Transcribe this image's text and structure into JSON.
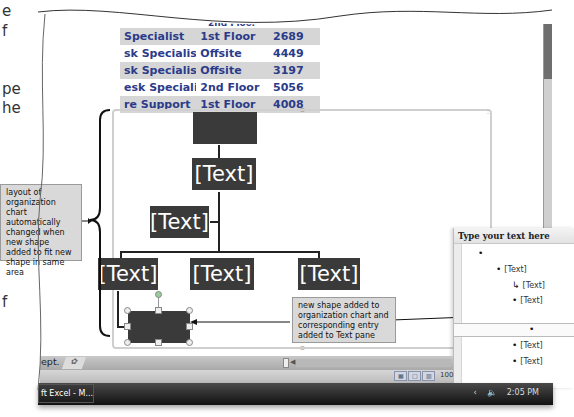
{
  "margin_fragments": [
    "e",
    "f",
    "pe",
    "he",
    "f"
  ],
  "spreadsheet": {
    "partial_top_row": "2nd Floor",
    "rows": [
      {
        "title": "Specialist",
        "location": "1st Floor",
        "ext": "2689",
        "shaded": true
      },
      {
        "title": "sk Specialist",
        "location": "Offsite",
        "ext": "4449",
        "shaded": false
      },
      {
        "title": "sk Specialist",
        "location": "Offsite",
        "ext": "3197",
        "shaded": true
      },
      {
        "title": "esk Specialist",
        "location": "2nd Floor",
        "ext": "5056",
        "shaded": false
      },
      {
        "title": "re Support",
        "location": "1st Floor",
        "ext": "4008",
        "shaded": true
      }
    ]
  },
  "org_chart": {
    "top_box": "",
    "level2": "[Text]",
    "assistant": "[Text]",
    "level3": [
      "[Text]",
      "[Text]",
      "[Text]"
    ],
    "new_shape": ""
  },
  "callouts": {
    "layout": "layout of organization chart automatically changed when new shape added to fit new shape in same area",
    "new_shape": "new shape added to organization chart and corresponding entry added to Text pane"
  },
  "text_pane": {
    "title": "Type your text here",
    "items": [
      {
        "text": "",
        "level": 0
      },
      {
        "text": "[Text]",
        "level": 1
      },
      {
        "text": "[Text]",
        "level": 2,
        "assistant": true
      },
      {
        "text": "[Text]",
        "level": 2
      },
      {
        "text": "",
        "level": 2,
        "active": true
      },
      {
        "text": "[Text]",
        "level": 2
      },
      {
        "text": "[Text]",
        "level": 2
      }
    ]
  },
  "sheet_tabs": {
    "current_tab_fragment": "ept.",
    "new_sheet_icon": "insert-worksheet-icon"
  },
  "status_bar": {
    "zoom": "100",
    "views": [
      "normal-view-icon",
      "page-layout-icon",
      "page-break-icon"
    ]
  },
  "taskbar": {
    "app_button": "ft Excel - M...",
    "clock": "2:05 PM",
    "tray_icons": [
      "chevron-left-icon",
      "speaker-icon"
    ]
  }
}
